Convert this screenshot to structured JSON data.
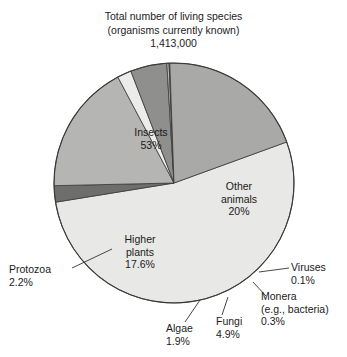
{
  "chart_data": {
    "type": "pie",
    "title": "Total number of living species (organisms currently known) 1,413,000",
    "title_lines": [
      "Total number of living species",
      "(organisms currently known)",
      "1,413,000"
    ],
    "total_label": "1,413,000",
    "total_value": 1413000,
    "categories": [
      "Insects",
      "Other animals",
      "Higher plants",
      "Fungi",
      "Protozoa",
      "Algae",
      "Monera (e.g., bacteria)",
      "Viruses"
    ],
    "values": [
      53,
      20,
      17.6,
      4.9,
      2.2,
      1.9,
      0.3,
      0.1
    ],
    "value_labels": [
      "53%",
      "20%",
      "17.6%",
      "4.9%",
      "2.2%",
      "1.9%",
      "0.3%",
      "0.1%"
    ],
    "xlabel": "",
    "ylabel": "",
    "legend": "none",
    "grid": false,
    "slice_colors": [
      "#e8e8e6",
      "#a9a9a7",
      "#b5b5b3",
      "#8f8f8d",
      "#6e6e6c",
      "#ececeb",
      "#bdbdbb",
      "#8a8a88"
    ],
    "slices": [
      {
        "name": "Insects",
        "label": "Insects",
        "percent_label": "53%",
        "value": 53,
        "color": "#e8e8e6"
      },
      {
        "name": "Protozoa",
        "label": "Protozoa",
        "percent_label": "2.2%",
        "value": 2.2,
        "color": "#6e6e6c"
      },
      {
        "name": "Higher plants",
        "label": "Higher plants",
        "percent_label": "17.6%",
        "value": 17.6,
        "color": "#b5b5b3"
      },
      {
        "name": "Algae",
        "label": "Algae",
        "percent_label": "1.9%",
        "value": 1.9,
        "color": "#ececeb"
      },
      {
        "name": "Fungi",
        "label": "Fungi",
        "percent_label": "4.9%",
        "value": 4.9,
        "color": "#8f8f8d"
      },
      {
        "name": "Monera",
        "label": "Monera",
        "percent_label": "0.3%",
        "value": 0.3,
        "color": "#bdbdbb"
      },
      {
        "name": "Viruses",
        "label": "Viruses",
        "percent_label": "0.1%",
        "value": 0.1,
        "color": "#8a8a88"
      },
      {
        "name": "Other animals",
        "label": "Other animals",
        "percent_label": "20%",
        "value": 20,
        "color": "#a9a9a7"
      }
    ]
  },
  "labels": {
    "insects": {
      "name": "Insects",
      "pct": "53%"
    },
    "other_animals": {
      "line1": "Other",
      "line2": "animals",
      "pct": "20%"
    },
    "higher_plants": {
      "line1": "Higher",
      "line2": "plants",
      "pct": "17.6%"
    },
    "protozoa": {
      "name": "Protozoa",
      "pct": "2.2%"
    },
    "algae": {
      "name": "Algae",
      "pct": "1.9%"
    },
    "fungi": {
      "name": "Fungi",
      "pct": "4.9%"
    },
    "monera": {
      "line1": "Monera",
      "line2": "(e.g., bacteria)",
      "pct": "0.3%"
    },
    "viruses": {
      "name": "Viruses",
      "pct": "0.1%"
    }
  }
}
